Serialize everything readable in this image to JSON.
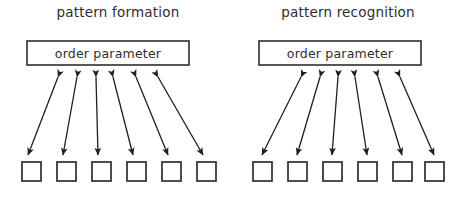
{
  "figure": {
    "width": 459,
    "height": 209,
    "background": "#ffffff",
    "stroke_color": "#1f1f1f",
    "box_stroke_color": "#2e2e2e",
    "unit_stroke_color": "#3a3a3a",
    "text_color": "#2e2e2e",
    "faint_text_color": "#8e8e8e"
  },
  "panels": [
    {
      "id": "pattern-formation",
      "title": "pattern formation",
      "order_parameter_label": "order parameter",
      "bottom_label": "",
      "unit_count": 6,
      "arrow_count": 6,
      "arrow_style": "double-headed"
    },
    {
      "id": "pattern-recognition",
      "title": "pattern recognition",
      "order_parameter_label": "order parameter",
      "bottom_label": "",
      "unit_count": 6,
      "arrow_count": 6,
      "arrow_style": "double-headed"
    }
  ],
  "geometry": {
    "left_panel": {
      "title_x": 118,
      "title_y": 17,
      "box": {
        "x": 27,
        "y": 41,
        "w": 162,
        "h": 24
      },
      "box_label_x": 108,
      "box_label_y": 58,
      "converge_x": 118,
      "converge_y": 76,
      "units_y": 162,
      "unit_size": 19,
      "unit_xs": [
        22,
        57,
        92,
        127,
        162,
        197
      ],
      "arrow_top_xs": [
        58,
        77,
        96,
        113,
        136,
        158
      ],
      "arrow_bottom_xs": [
        28,
        63,
        98,
        133,
        168,
        203
      ],
      "arrow_top_y": 77,
      "arrow_bottom_y": 155
    },
    "right_panel": {
      "title_x": 348,
      "title_y": 17,
      "box": {
        "x": 259,
        "y": 41,
        "w": 162,
        "h": 24
      },
      "box_label_x": 340,
      "box_label_y": 58,
      "units_y": 162,
      "unit_size": 19,
      "unit_xs": [
        253,
        288,
        323,
        358,
        393,
        425
      ],
      "arrow_top_xs": [
        301,
        320,
        338,
        355,
        378,
        400
      ],
      "arrow_bottom_xs": [
        262,
        297,
        332,
        367,
        402,
        434
      ],
      "arrow_top_y": 77,
      "arrow_bottom_y": 155
    }
  }
}
